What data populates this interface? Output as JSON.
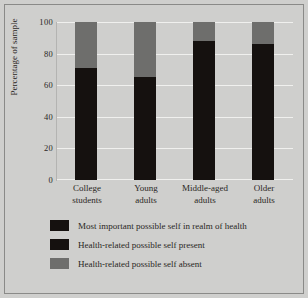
{
  "chart_data": {
    "type": "bar",
    "stacked": true,
    "title": "",
    "xlabel": "",
    "ylabel": "Percentage of sample",
    "ylim": [
      0,
      100
    ],
    "yticks": [
      100,
      80,
      60,
      40,
      20,
      0
    ],
    "grid": true,
    "legend_position": "bottom",
    "categories": [
      "College students",
      "Young adults",
      "Middle-aged adults",
      "Older adults"
    ],
    "category_lines": [
      [
        "College",
        "students"
      ],
      [
        "Young",
        "adults"
      ],
      [
        "Middle-aged",
        "adults"
      ],
      [
        "Older",
        "adults"
      ]
    ],
    "series": [
      {
        "name": "Most important possible self in realm of health",
        "color": "#15110f",
        "values": [
          0,
          0,
          0,
          0
        ]
      },
      {
        "name": "Health-related possible self present",
        "color": "#15110f",
        "values": [
          71,
          65,
          88,
          86
        ]
      },
      {
        "name": "Health-related possible self absent",
        "color": "#6e6e6c",
        "values": [
          29,
          35,
          12,
          14
        ]
      }
    ]
  },
  "legend": {
    "items": [
      {
        "label": "Most important possible self in realm of health",
        "color": "#15110f"
      },
      {
        "label": "Health-related possible self present",
        "color": "#15110f"
      },
      {
        "label": "Health-related possible self absent",
        "color": "#6e6e6c"
      }
    ]
  },
  "colors": {
    "background": "#cfcfcd",
    "dark": "#15110f",
    "gray": "#6e6e6c",
    "gridline": "#f0f0ee",
    "text": "#2a2724",
    "border": "#8a8a88"
  }
}
